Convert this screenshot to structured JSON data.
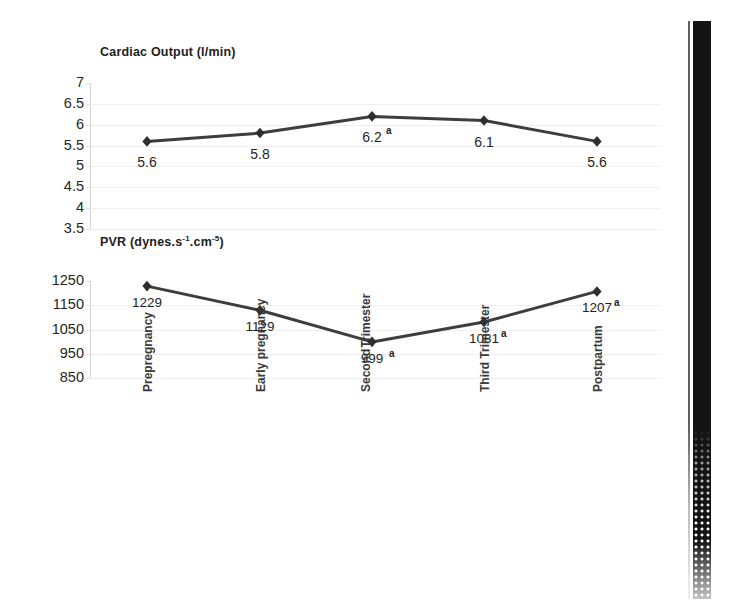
{
  "figure": {
    "background_color": "#ffffff",
    "line_color": "#3d3d3d",
    "marker_color": "#2e2e2e",
    "grid_color": "#efefef",
    "scan_artifact": {
      "name": "scanned-page-edge-band",
      "color": "#141414"
    }
  },
  "categories": [
    {
      "lines": [
        "Prepregnancy"
      ]
    },
    {
      "lines": [
        "Early pregnancy"
      ]
    },
    {
      "lines": [
        "Second",
        "Trimester"
      ]
    },
    {
      "lines": [
        "Third Trimester"
      ]
    },
    {
      "lines": [
        "Postpartum"
      ]
    }
  ],
  "chart_data": [
    {
      "type": "line",
      "title": "Cardiac  Output (l/min)",
      "title_main": "Cardiac  Output (l/min)",
      "xlabel": "",
      "ylabel": "",
      "ylim": [
        3.5,
        7
      ],
      "yticks": [
        "7",
        "6.5",
        "6",
        "5.5",
        "5",
        "4.5",
        "4",
        "3.5"
      ],
      "ytick_values": [
        7,
        6.5,
        6,
        5.5,
        5,
        4.5,
        4,
        3.5
      ],
      "grid": true,
      "legend": "none",
      "categories": [
        "Prepregnancy",
        "Early pregnancy",
        "Second Trimester",
        "Third Trimester",
        "Postpartum"
      ],
      "values": [
        5.6,
        5.8,
        6.2,
        6.1,
        5.6
      ],
      "point_labels": [
        "5.6",
        "5.8",
        "6.2",
        "6.1",
        "5.6"
      ],
      "annotations": [
        {
          "index": 2,
          "marker": "a",
          "note": "superscript a at Second Trimester"
        }
      ]
    },
    {
      "type": "line",
      "title": "PVR (dynes.s-1.cm-5)",
      "title_parts": {
        "prefix": "PVR (dynes.s",
        "sup1": "-1",
        "mid": ".cm",
        "sup2": "-5",
        "suffix": ")"
      },
      "xlabel": "",
      "ylabel": "",
      "ylim": [
        850,
        1250
      ],
      "yticks": [
        "1250",
        "1150",
        "1050",
        "950",
        "850"
      ],
      "ytick_values": [
        1250,
        1150,
        1050,
        950,
        850
      ],
      "grid": true,
      "legend": "none",
      "categories": [
        "Prepregnancy",
        "Early pregnancy",
        "Second Trimester",
        "Third Trimester",
        "Postpartum"
      ],
      "values": [
        1229,
        1129,
        999,
        1081,
        1207
      ],
      "point_labels": [
        "1229",
        "1129",
        "999",
        "1081",
        "1207"
      ],
      "annotations": [
        {
          "index": 2,
          "marker": "a",
          "note": "superscript a at Second Trimester"
        },
        {
          "index": 3,
          "marker": "a",
          "note": "superscript a at Third Trimester"
        },
        {
          "index": 4,
          "marker": "a",
          "note": "superscript a at Postpartum"
        }
      ]
    }
  ]
}
